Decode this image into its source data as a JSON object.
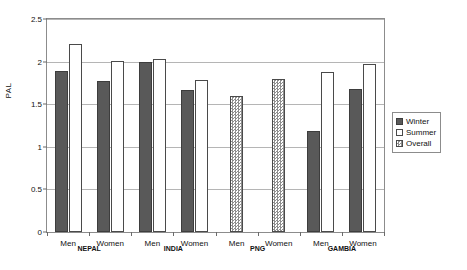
{
  "chart_data": {
    "type": "bar",
    "title": "",
    "xlabel": "",
    "ylabel": "PAL",
    "ylim": [
      0,
      2.5
    ],
    "ytick_labels": [
      "0",
      "0.5",
      "1",
      "1.5",
      "2",
      "2.5"
    ],
    "ytick_values": [
      0,
      0.5,
      1,
      1.5,
      2,
      2.5
    ],
    "grid": "horizontal",
    "legend_position": "right-outside",
    "legend": [
      "Winter",
      "Summer",
      "Overall"
    ],
    "colors": {
      "winter": "#595959",
      "summer": "#ffffff",
      "overall": "#8f8f8f",
      "axis": "#8c8c8c",
      "grid": "#b5b5b5"
    },
    "countries": [
      "NEPAL",
      "INDIA",
      "PNG",
      "GAMBIA"
    ],
    "categories": [
      "NEPAL Men",
      "NEPAL Women",
      "INDIA Men",
      "INDIA Women",
      "PNG Men",
      "PNG Women",
      "GAMBIA Men",
      "GAMBIA Women"
    ],
    "series": [
      {
        "name": "Winter",
        "values": [
          1.89,
          1.77,
          2.0,
          1.67,
          null,
          null,
          1.18,
          1.68
        ]
      },
      {
        "name": "Summer",
        "values": [
          2.21,
          2.01,
          2.03,
          1.79,
          null,
          null,
          1.88,
          1.97
        ]
      },
      {
        "name": "Overall",
        "values": [
          null,
          null,
          null,
          null,
          1.6,
          1.8,
          null,
          null
        ]
      }
    ],
    "groups": [
      {
        "country": "NEPAL",
        "sexes": [
          {
            "label": "Men",
            "bars": [
              {
                "series": "Winter",
                "value": 1.89
              },
              {
                "series": "Summer",
                "value": 2.21
              }
            ]
          },
          {
            "label": "Women",
            "bars": [
              {
                "series": "Winter",
                "value": 1.77
              },
              {
                "series": "Summer",
                "value": 2.01
              }
            ]
          }
        ]
      },
      {
        "country": "INDIA",
        "sexes": [
          {
            "label": "Men",
            "bars": [
              {
                "series": "Winter",
                "value": 2.0
              },
              {
                "series": "Summer",
                "value": 2.03
              }
            ]
          },
          {
            "label": "Women",
            "bars": [
              {
                "series": "Winter",
                "value": 1.67
              },
              {
                "series": "Summer",
                "value": 1.79
              }
            ]
          }
        ]
      },
      {
        "country": "PNG",
        "sexes": [
          {
            "label": "Men",
            "bars": [
              {
                "series": "Overall",
                "value": 1.6
              }
            ]
          },
          {
            "label": "Women",
            "bars": [
              {
                "series": "Overall",
                "value": 1.8
              }
            ]
          }
        ]
      },
      {
        "country": "GAMBIA",
        "sexes": [
          {
            "label": "Men",
            "bars": [
              {
                "series": "Winter",
                "value": 1.18
              },
              {
                "series": "Summer",
                "value": 1.88
              }
            ]
          },
          {
            "label": "Women",
            "bars": [
              {
                "series": "Winter",
                "value": 1.68
              },
              {
                "series": "Summer",
                "value": 1.97
              }
            ]
          }
        ]
      }
    ]
  }
}
